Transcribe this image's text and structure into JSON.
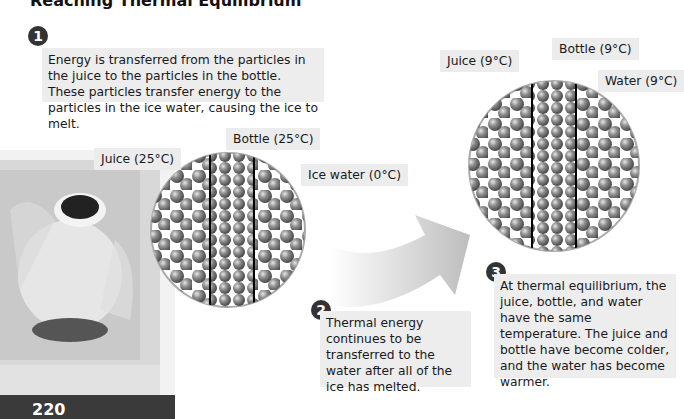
{
  "title": "Reaching Thermal Equilibrium",
  "page_number": "220",
  "steps": [
    {
      "number": "1",
      "text": "Energy is transferred from the particles in the juice to the particles in the bottle. These particles transfer energy to the particles in the ice water, causing the ice to melt."
    },
    {
      "number": "2",
      "text": "Thermal energy continues to be transferred to the water after all of the ice has melted."
    },
    {
      "number": "3",
      "text": "At thermal equilibrium, the juice, bottle, and water have the same temperature. The juice and bottle have become colder, and the water has become warmer."
    }
  ],
  "initial_labels": {
    "juice": "Juice (25°C)",
    "bottle": "Bottle (25°C)",
    "ice_water": "Ice water (0°C)"
  },
  "final_labels": {
    "juice": "Juice (9°C)",
    "bottle": "Bottle (9°C)",
    "water": "Water (9°C)"
  },
  "colors": {
    "label_bg": "#ececec",
    "badge": "#333333",
    "particle": "#8a8a8a",
    "cooler": "#3a3a3a"
  }
}
